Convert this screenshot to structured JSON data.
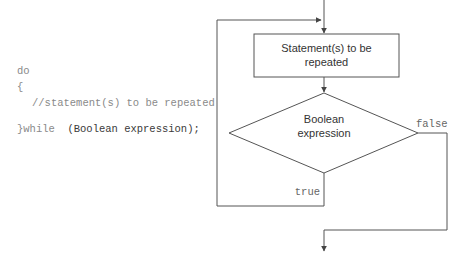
{
  "code": {
    "line1": "do",
    "line2": "{",
    "line3": "//statement(s) to be repeated",
    "line4_prefix": "}while",
    "line4_condition": "(Boolean expression);"
  },
  "flowchart": {
    "statement_box": {
      "line1": "Statement(s) to be",
      "line2": "repeated"
    },
    "decision": {
      "line1": "Boolean",
      "line2": "expression"
    },
    "true_label": "true",
    "false_label": "false"
  },
  "colors": {
    "line": "#555555",
    "code_text": "#8a8a8a"
  }
}
